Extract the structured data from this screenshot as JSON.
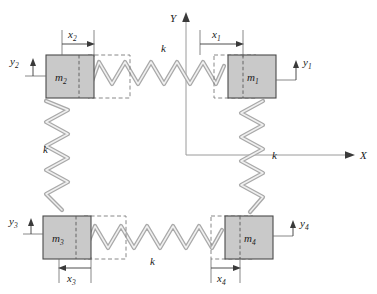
{
  "figure": {
    "background": "#ffffff",
    "block_fill": "#c9c9c9",
    "block_stroke": "#4a4a4a",
    "spring_stroke": "#a9a9a9",
    "spring_highlight": "#efefef",
    "dashed_stroke": "#7a7a7a",
    "axis_stroke": "#9a9a9a",
    "label_color": "#1a1a1a"
  },
  "axes": {
    "y_axis_label": "Y",
    "x_axis_label": "X",
    "origin_note": "center of frame"
  },
  "masses": [
    {
      "id": "m1",
      "symbol": "m",
      "subscript": "1",
      "position": "top-right"
    },
    {
      "id": "m2",
      "symbol": "m",
      "subscript": "2",
      "position": "top-left"
    },
    {
      "id": "m3",
      "symbol": "m",
      "subscript": "3",
      "position": "bottom-left"
    },
    {
      "id": "m4",
      "symbol": "m",
      "subscript": "4",
      "position": "bottom-right"
    }
  ],
  "displacements": [
    {
      "id": "x1",
      "symbol": "x",
      "subscript": "1",
      "direction": "right",
      "near": "m1"
    },
    {
      "id": "x2",
      "symbol": "x",
      "subscript": "2",
      "direction": "right",
      "near": "m2"
    },
    {
      "id": "x3",
      "symbol": "x",
      "subscript": "3",
      "direction": "left",
      "near": "m3"
    },
    {
      "id": "x4",
      "symbol": "x",
      "subscript": "4",
      "direction": "right",
      "near": "m4"
    },
    {
      "id": "y1",
      "symbol": "y",
      "subscript": "1",
      "direction": "up",
      "near": "m1"
    },
    {
      "id": "y2",
      "symbol": "y",
      "subscript": "2",
      "direction": "up",
      "near": "m2"
    },
    {
      "id": "y3",
      "symbol": "y",
      "subscript": "3",
      "direction": "up",
      "near": "m3"
    },
    {
      "id": "y4",
      "symbol": "y",
      "subscript": "4",
      "direction": "up",
      "near": "m4"
    }
  ],
  "springs": [
    {
      "id": "k-top",
      "label": "k",
      "orientation": "horizontal",
      "connects": [
        "m2",
        "m1"
      ]
    },
    {
      "id": "k-left",
      "label": "k",
      "orientation": "vertical",
      "connects": [
        "m2",
        "m3"
      ]
    },
    {
      "id": "k-right",
      "label": "k",
      "orientation": "vertical",
      "connects": [
        "m1",
        "m4"
      ]
    },
    {
      "id": "k-bottom",
      "label": "k",
      "orientation": "horizontal",
      "connects": [
        "m3",
        "m4"
      ]
    }
  ]
}
